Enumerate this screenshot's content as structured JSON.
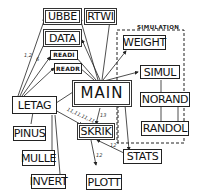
{
  "diagram": {
    "group": {
      "title": "SIMULATION"
    },
    "nodes": {
      "ubbe": "UBBE",
      "rtwi": "RTWI",
      "data": "DATA",
      "readi": "READI",
      "readr": "READR",
      "weight": "WEIGHT",
      "simul": "SIMUL",
      "main": "MAIN",
      "norand": "NORAND",
      "randol": "RANDOL",
      "letag": "LETAG",
      "pinus": "PINUS",
      "skrik": "SKRIK",
      "stats": "STATS",
      "mulle": "MULLE",
      "invert": "INVERT",
      "plott": "PLOTT"
    },
    "edge_labels": {
      "letag_ubbe": "1,2",
      "letag_data": "6",
      "main_skrik": "13",
      "letag_skrik": "11,11,11,11",
      "skrik_stats": "12",
      "skrik_plott": "12"
    }
  }
}
